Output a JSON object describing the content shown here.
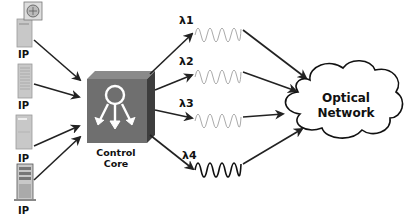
{
  "diagram": {
    "sources": [
      {
        "label": "IP",
        "icon": "workstation-with-monitor-icon"
      },
      {
        "label": "IP",
        "icon": "tower-server-icon"
      },
      {
        "label": "IP",
        "icon": "desktop-server-icon"
      },
      {
        "label": "IP",
        "icon": "rack-server-icon"
      }
    ],
    "core": {
      "line1": "Control",
      "line2": "Core"
    },
    "wavelengths": [
      {
        "label": "λ1",
        "color": "#aaaaaa"
      },
      {
        "label": "λ2",
        "color": "#aaaaaa"
      },
      {
        "label": "λ3",
        "color": "#aaaaaa"
      },
      {
        "label": "λ4",
        "color": "#111111"
      }
    ],
    "cloud": {
      "line1": "Optical",
      "line2": "Network"
    },
    "colors": {
      "arrow": "#222222",
      "core_face": "#6f6f6f",
      "core_top": "#8a8a8a",
      "core_side": "#3d3d3d",
      "server": "#c8c8c8"
    }
  }
}
